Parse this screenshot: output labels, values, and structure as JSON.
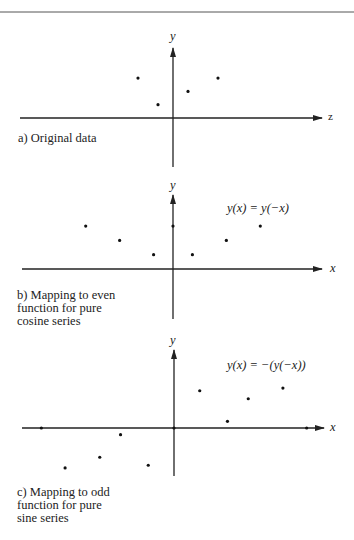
{
  "figure": {
    "top_rule": true,
    "panels": [
      {
        "id": "a",
        "caption": "a) Original data",
        "equation": "",
        "x_axis_label": "z",
        "y_axis_label": "y",
        "points": [
          [
            -3.5,
            3
          ],
          [
            -1.5,
            1
          ],
          [
            1.5,
            2
          ],
          [
            4.5,
            3
          ]
        ]
      },
      {
        "id": "b",
        "caption": "b) Mapping to even\nfunction for pure\ncosine series",
        "equation": "y(x) = y(−x)",
        "x_axis_label": "x",
        "y_axis_label": "y",
        "points": [
          [
            -9,
            3
          ],
          [
            -5.5,
            2
          ],
          [
            -2,
            1
          ],
          [
            0,
            3
          ],
          [
            2,
            1
          ],
          [
            5.5,
            2
          ],
          [
            9,
            3
          ]
        ]
      },
      {
        "id": "c",
        "caption": "c) Mapping to odd\nfunction for pure\nsine series",
        "equation": "y(x) = −(y(−x))",
        "x_axis_label": "x",
        "y_axis_label": "y",
        "points": [
          [
            -13.4,
            0
          ],
          [
            -11,
            -3
          ],
          [
            -7.5,
            -2.2
          ],
          [
            -5.4,
            -0.5
          ],
          [
            -2.6,
            -2.8
          ],
          [
            0,
            0
          ],
          [
            2.6,
            2.8
          ],
          [
            5.4,
            0.5
          ],
          [
            7.5,
            2.2
          ],
          [
            11,
            3
          ],
          [
            13.4,
            0
          ]
        ]
      }
    ]
  },
  "chart_data": [
    {
      "type": "scatter",
      "title": "a) Original data",
      "xlabel": "z",
      "ylabel": "y",
      "x": [
        -3.5,
        -1.5,
        1.5,
        4.5
      ],
      "y": [
        3,
        1,
        2,
        3
      ],
      "grid": false
    },
    {
      "type": "scatter",
      "title": "b) Mapping to even function for pure cosine series",
      "annotation": "y(x) = y(−x)",
      "xlabel": "x",
      "ylabel": "y",
      "x": [
        -9,
        -5.5,
        -2,
        0,
        2,
        5.5,
        9
      ],
      "y": [
        3,
        2,
        1,
        3,
        1,
        2,
        3
      ],
      "grid": false
    },
    {
      "type": "scatter",
      "title": "c) Mapping to odd function for pure sine series",
      "annotation": "y(x) = −(y(−x))",
      "xlabel": "x",
      "ylabel": "y",
      "x": [
        -13.4,
        -11,
        -7.5,
        -5.4,
        -2.6,
        0,
        2.6,
        5.4,
        7.5,
        11,
        13.4
      ],
      "y": [
        0,
        -3,
        -2.2,
        -0.5,
        -2.8,
        0,
        2.8,
        0.5,
        2.2,
        3,
        0
      ],
      "grid": false
    }
  ]
}
